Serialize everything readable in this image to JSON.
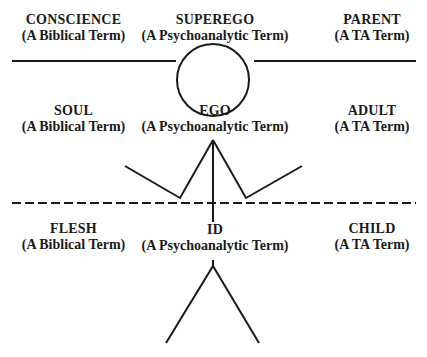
{
  "diagram": {
    "rows": [
      {
        "left": {
          "title": "CONSCIENCE",
          "subtitle": "(A Biblical Term)"
        },
        "center": {
          "title": "SUPEREGO",
          "subtitle": "(A Psychoanalytic Term)"
        },
        "right": {
          "title": "PARENT",
          "subtitle": "(A TA Term)"
        }
      },
      {
        "left": {
          "title": "SOUL",
          "subtitle": "(A Biblical Term)"
        },
        "center": {
          "title": "EGO",
          "subtitle": "(A Psychoanalytic Term)"
        },
        "right": {
          "title": "ADULT",
          "subtitle": "(A TA Term)"
        }
      },
      {
        "left": {
          "title": "FLESH",
          "subtitle": "(A Biblical Term)"
        },
        "center": {
          "title": "ID",
          "subtitle": "(A Psychoanalytic Term)"
        },
        "right": {
          "title": "CHILD",
          "subtitle": "(A TA Term)"
        }
      }
    ],
    "stick_figure": {
      "head": "circle",
      "arms": "raised-V",
      "legs": "inverted-V"
    },
    "dividers": [
      "solid",
      "dashed"
    ],
    "colors": {
      "ink": "#1a1a1a",
      "background": "#ffffff"
    }
  }
}
